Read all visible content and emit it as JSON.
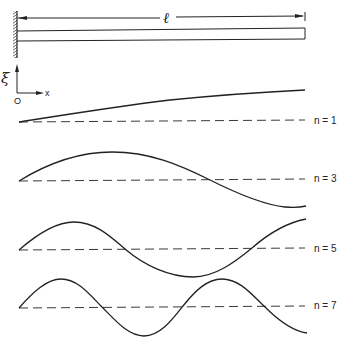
{
  "figure": {
    "type": "cantilever beam mode shapes",
    "length_label": "ℓ",
    "axis": {
      "vertical_label": "ξ",
      "origin_label": "O",
      "horizontal_label": "x"
    },
    "modes": [
      {
        "label": "n = 1",
        "n": 1
      },
      {
        "label": "n = 3",
        "n": 3
      },
      {
        "label": "n = 5",
        "n": 5
      },
      {
        "label": "n = 7",
        "n": 7
      }
    ]
  },
  "colors": {
    "stroke": "#222222",
    "background": "#ffffff"
  }
}
